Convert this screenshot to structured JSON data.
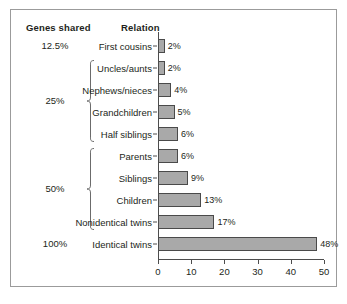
{
  "headers": {
    "genes_shared": "Genes shared",
    "relation": "Relation"
  },
  "groups": [
    {
      "label": "12.5%",
      "braced": false,
      "rows": [
        0
      ]
    },
    {
      "label": "25%",
      "braced": true,
      "rows": [
        1,
        2,
        3,
        4
      ]
    },
    {
      "label": "50%",
      "braced": true,
      "rows": [
        5,
        6,
        7,
        8
      ]
    },
    {
      "label": "100%",
      "braced": false,
      "rows": [
        9
      ]
    }
  ],
  "axis": {
    "ticks": [
      "0",
      "10",
      "20",
      "30",
      "40",
      "50"
    ],
    "min": 0,
    "max": 50
  },
  "chart_data": {
    "type": "bar",
    "orientation": "horizontal",
    "title": "",
    "xlabel": "",
    "ylabel": "",
    "xlim": [
      0,
      50
    ],
    "grid": false,
    "legend": false,
    "categories": [
      "First cousins",
      "Uncles/aunts",
      "Nephews/nieces",
      "Grandchildren",
      "Half siblings",
      "Parents",
      "Siblings",
      "Children",
      "Nonidentical twins",
      "Identical twins"
    ],
    "values": [
      2,
      2,
      4,
      5,
      6,
      6,
      9,
      13,
      17,
      48
    ],
    "value_labels": [
      "2%",
      "2%",
      "4%",
      "5%",
      "6%",
      "6%",
      "9%",
      "13%",
      "17%",
      "48%"
    ],
    "group_labels": [
      "12.5%",
      "25%",
      "25%",
      "25%",
      "25%",
      "50%",
      "50%",
      "50%",
      "50%",
      "100%"
    ],
    "xticks": [
      0,
      10,
      20,
      30,
      40,
      50
    ],
    "xticklabels": [
      "0",
      "10",
      "20",
      "30",
      "40",
      "50"
    ],
    "bar_color": "#a9a9a9",
    "bar_edge_color": "#4a4a4a"
  }
}
